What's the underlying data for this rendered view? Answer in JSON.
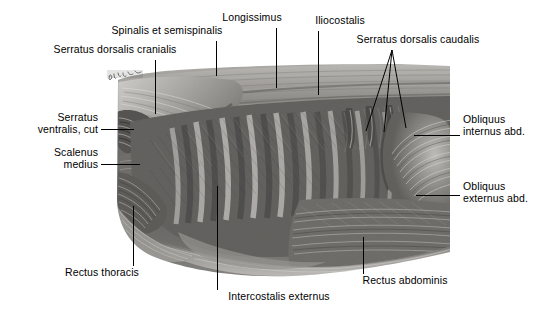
{
  "figure": {
    "kind": "anatomical-illustration",
    "rendering": "grayscale pencil / halftone drawing",
    "artist_signature": "illegible cursive signature, upper-left of plate",
    "background_color": "#ffffff",
    "ink_color": "#000000",
    "plate_tone_light": "#d8d6d2",
    "plate_tone_mid": "#8f8d8a",
    "plate_tone_dark": "#3a3937"
  },
  "labels": [
    {
      "id": "serratus-dorsalis-cranialis",
      "text": "Serratus dorsalis cranialis",
      "align": "center",
      "text_x": 115,
      "text_y": 49,
      "leader": {
        "type": "line",
        "points": [
          [
            155,
            60
          ],
          [
            155,
            114
          ]
        ]
      }
    },
    {
      "id": "spinalis-et-semispinalis",
      "text": "Spinalis et semispinalis",
      "align": "center",
      "text_x": 167,
      "text_y": 30,
      "leader": {
        "type": "line",
        "points": [
          [
            216,
            41
          ],
          [
            216,
            76
          ]
        ]
      }
    },
    {
      "id": "longissimus",
      "text": "Longissimus",
      "align": "center",
      "text_x": 252,
      "text_y": 17,
      "leader": {
        "type": "line",
        "points": [
          [
            276,
            28
          ],
          [
            276,
            88
          ]
        ]
      }
    },
    {
      "id": "iliocostalis",
      "text": "Iliocostalis",
      "align": "center",
      "text_x": 340,
      "text_y": 20,
      "leader": {
        "type": "line",
        "points": [
          [
            318,
            31
          ],
          [
            318,
            95
          ]
        ]
      }
    },
    {
      "id": "serratus-dorsalis-caudalis",
      "text": "Serratus dorsalis caudalis",
      "align": "center",
      "text_x": 418,
      "text_y": 39,
      "leader": {
        "type": "fan",
        "apex": [
          392,
          50
        ],
        "tips": [
          [
            366,
            131
          ],
          [
            384,
            132
          ],
          [
            406,
            128
          ]
        ]
      }
    },
    {
      "id": "serratus-ventralis-cut",
      "text": "Serratus\nventralis, cut",
      "align": "right",
      "text_x": 96,
      "text_y": 117,
      "leader": {
        "type": "line",
        "points": [
          [
            101,
            129
          ],
          [
            134,
            129
          ]
        ]
      }
    },
    {
      "id": "scalenus-medius",
      "text": "Scalenus\nmedius",
      "align": "right",
      "text_x": 96,
      "text_y": 152,
      "leader": {
        "type": "line",
        "points": [
          [
            101,
            164
          ],
          [
            140,
            164
          ]
        ]
      }
    },
    {
      "id": "obliquus-internus-abd",
      "text": "Obliquus\ninternus abd.",
      "align": "left",
      "text_x": 464,
      "text_y": 119,
      "leader": {
        "type": "line",
        "points": [
          [
            414,
            135
          ],
          [
            460,
            135
          ]
        ]
      }
    },
    {
      "id": "obliquus-externus-abd",
      "text": "Obliquus\nexternus abd.",
      "align": "left",
      "text_x": 464,
      "text_y": 186,
      "leader": {
        "type": "line",
        "points": [
          [
            416,
            195
          ],
          [
            460,
            195
          ]
        ]
      }
    },
    {
      "id": "rectus-thoracis",
      "text": "Rectus thoracis",
      "align": "center",
      "text_x": 102,
      "text_y": 272,
      "leader": {
        "type": "line",
        "points": [
          [
            133,
            206
          ],
          [
            133,
            266
          ]
        ]
      }
    },
    {
      "id": "intercostalis-externus",
      "text": "Intercostalis externus",
      "align": "center",
      "text_x": 279,
      "text_y": 296,
      "leader": {
        "type": "line",
        "points": [
          [
            217,
            186
          ],
          [
            217,
            290
          ]
        ]
      }
    },
    {
      "id": "rectus-abdominis",
      "text": "Rectus abdominis",
      "align": "center",
      "text_x": 405,
      "text_y": 280,
      "leader": {
        "type": "line",
        "points": [
          [
            363,
            237
          ],
          [
            363,
            274
          ]
        ]
      }
    }
  ]
}
